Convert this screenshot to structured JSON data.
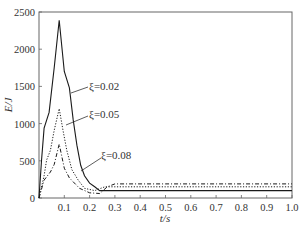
{
  "chart_data": {
    "type": "line",
    "title": "",
    "xlabel": "t/s",
    "ylabel": "E/J",
    "xlim": [
      0,
      1.0
    ],
    "ylim": [
      0,
      2500
    ],
    "xticks": [
      0.1,
      0.2,
      0.3,
      0.4,
      0.5,
      0.6,
      0.7,
      0.8,
      0.9,
      1.0
    ],
    "xtick_labels": [
      "0.1",
      "0.2",
      "0.3",
      "0.4",
      "0.5",
      "0.6",
      "0.7",
      "0.8",
      "0.9",
      "1.0"
    ],
    "yticks": [
      0,
      500,
      1000,
      1500,
      2000,
      2500
    ],
    "ytick_labels": [
      "0",
      "500",
      "1000",
      "1500",
      "2000",
      "2500"
    ],
    "grid": false,
    "legend": "inline annotations with leader lines",
    "series": [
      {
        "name": "ξ=0.02",
        "style": "solid",
        "x": [
          0,
          0.01,
          0.02,
          0.04,
          0.06,
          0.08,
          0.1,
          0.12,
          0.135,
          0.15,
          0.165,
          0.18,
          0.2,
          0.22,
          0.24,
          0.26,
          0.3,
          0.5,
          0.7,
          1.0
        ],
        "y": [
          0,
          500,
          940,
          1150,
          1750,
          2390,
          1700,
          1480,
          1050,
          710,
          440,
          300,
          200,
          150,
          100,
          100,
          100,
          100,
          100,
          100
        ]
      },
      {
        "name": "ξ=0.05",
        "style": "dotted",
        "x": [
          0,
          0.02,
          0.03,
          0.045,
          0.06,
          0.08,
          0.095,
          0.11,
          0.13,
          0.155,
          0.18,
          0.22,
          0.26,
          0.3,
          0.5,
          0.7,
          1.0
        ],
        "y": [
          0,
          300,
          510,
          640,
          910,
          1200,
          910,
          640,
          380,
          240,
          130,
          100,
          150,
          150,
          150,
          150,
          150
        ]
      },
      {
        "name": "ξ=0.08",
        "style": "dash-dot",
        "x": [
          0,
          0.02,
          0.045,
          0.06,
          0.08,
          0.1,
          0.12,
          0.16,
          0.2,
          0.24,
          0.27,
          0.3,
          0.5,
          0.7,
          1.0
        ],
        "y": [
          0,
          240,
          350,
          450,
          725,
          400,
          270,
          130,
          70,
          60,
          150,
          190,
          190,
          190,
          190
        ]
      }
    ],
    "annotations": [
      {
        "text": "ξ=0.02",
        "series": "ξ=0.02"
      },
      {
        "text": "ξ=0.05",
        "series": "ξ=0.05"
      },
      {
        "text": "ξ=0.08",
        "series": "ξ=0.08"
      }
    ]
  },
  "axes": {
    "x_label": "t/s",
    "y_label": "E/J"
  },
  "annotations": {
    "a1": "ξ=0.02",
    "a2": "ξ=0.05",
    "a3": "ξ=0.08"
  },
  "colors": {
    "line": "#1a1a1a",
    "axis": "#555555",
    "text": "#333333"
  }
}
